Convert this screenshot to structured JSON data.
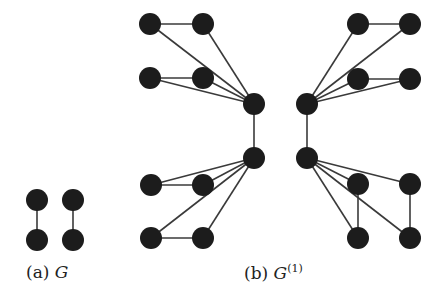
{
  "figure": {
    "subfigures": [
      {
        "id": "a",
        "caption_label": "(a)",
        "caption_symbol": "G",
        "caption_superscript": "",
        "nodes": [
          [
            37,
            200
          ],
          [
            73,
            200
          ],
          [
            37,
            240
          ],
          [
            73,
            240
          ]
        ],
        "edges": [
          [
            0,
            2
          ],
          [
            1,
            3
          ]
        ]
      },
      {
        "id": "b",
        "caption_label": "(b)",
        "caption_symbol": "G",
        "caption_superscript": "(1)",
        "nodes": [
          [
            150,
            24
          ],
          [
            203,
            24
          ],
          [
            150,
            78
          ],
          [
            203,
            78
          ],
          [
            254,
            104
          ],
          [
            254,
            158
          ],
          [
            151,
            185
          ],
          [
            203,
            185
          ],
          [
            151,
            238
          ],
          [
            203,
            238
          ],
          [
            307,
            104
          ],
          [
            358,
            24
          ],
          [
            410,
            24
          ],
          [
            358,
            79
          ],
          [
            410,
            79
          ],
          [
            307,
            158
          ],
          [
            358,
            184
          ],
          [
            410,
            184
          ],
          [
            358,
            238
          ],
          [
            410,
            238
          ]
        ],
        "edges": [
          [
            0,
            1
          ],
          [
            0,
            4
          ],
          [
            1,
            4
          ],
          [
            2,
            3
          ],
          [
            2,
            4
          ],
          [
            3,
            4
          ],
          [
            4,
            5
          ],
          [
            6,
            7
          ],
          [
            6,
            5
          ],
          [
            7,
            5
          ],
          [
            8,
            9
          ],
          [
            8,
            5
          ],
          [
            9,
            5
          ],
          [
            11,
            12
          ],
          [
            10,
            11
          ],
          [
            10,
            12
          ],
          [
            13,
            14
          ],
          [
            10,
            13
          ],
          [
            10,
            14
          ],
          [
            10,
            15
          ],
          [
            16,
            18
          ],
          [
            17,
            19
          ],
          [
            15,
            16
          ],
          [
            15,
            17
          ],
          [
            15,
            18
          ],
          [
            15,
            19
          ]
        ]
      }
    ],
    "colors": {
      "node": "#1c1c1c",
      "edge": "#3a3a3a",
      "background": "#ffffff"
    },
    "node_radius": 11
  }
}
